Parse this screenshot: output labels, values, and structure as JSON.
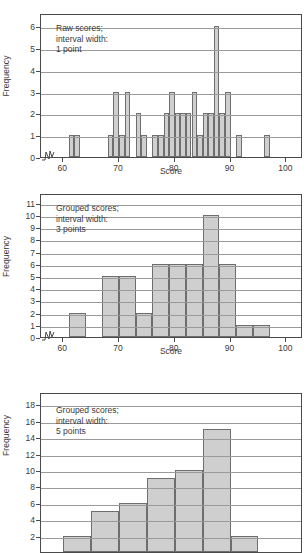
{
  "figures": [
    {
      "id": "histogram-raw-1pt",
      "annotation_lines": [
        "Raw scores;",
        "interval width:",
        "1 point"
      ],
      "chart_data": {
        "type": "bar",
        "title": "Raw scores; interval width: 1 point",
        "xlabel": "Score",
        "ylabel": "Frequency",
        "xlim": [
          56,
          103
        ],
        "ylim": [
          0,
          6.6
        ],
        "xticks": [
          60,
          70,
          80,
          90,
          100
        ],
        "yticks": [
          0,
          1,
          2,
          3,
          4,
          5,
          6
        ],
        "grid": true,
        "axis_break": true,
        "bin_width": 1,
        "categories": [
          61,
          62,
          68,
          69,
          70,
          71,
          73,
          74,
          76,
          77,
          78,
          79,
          80,
          81,
          82,
          83,
          84,
          85,
          86,
          87,
          88,
          89,
          91,
          96
        ],
        "values": [
          1,
          1,
          1,
          3,
          1,
          3,
          2,
          1,
          1,
          1,
          2,
          3,
          2,
          2,
          2,
          3,
          1,
          2,
          2,
          6,
          2,
          3,
          1,
          1
        ]
      }
    },
    {
      "id": "histogram-grouped-3pt",
      "annotation_lines": [
        "Grouped scores;",
        "interval width:",
        "3 points"
      ],
      "chart_data": {
        "type": "bar",
        "title": "Grouped scores; interval width: 3 points",
        "xlabel": "Score",
        "ylabel": "Frequency",
        "xlim": [
          56,
          103
        ],
        "ylim": [
          0,
          11.8
        ],
        "xticks": [
          60,
          70,
          80,
          90,
          100
        ],
        "yticks": [
          0,
          1,
          2,
          3,
          4,
          5,
          6,
          7,
          8,
          9,
          10,
          11
        ],
        "grid": true,
        "axis_break": true,
        "bin_width": 3,
        "categories": [
          61,
          67,
          70,
          73,
          76,
          79,
          82,
          85,
          88,
          91,
          94
        ],
        "values": [
          2,
          5,
          5,
          2,
          6,
          6,
          6,
          10,
          6,
          1,
          1
        ]
      }
    },
    {
      "id": "histogram-grouped-5pt",
      "annotation_lines": [
        "Grouped scores;",
        "interval width:",
        "5 points"
      ],
      "chart_data": {
        "type": "bar",
        "title": "Grouped scores; interval width: 5 points",
        "xlabel": "Score",
        "ylabel": "Frequency",
        "xlim": [
          56,
          103
        ],
        "ylim": [
          0,
          19.5
        ],
        "xticks": [],
        "yticks": [
          2,
          4,
          6,
          8,
          10,
          12,
          14,
          16,
          18
        ],
        "grid": true,
        "axis_break": true,
        "bin_width": 5,
        "categories": [
          60,
          65,
          70,
          75,
          80,
          85,
          90
        ],
        "values": [
          2,
          5,
          6,
          9,
          10,
          15,
          2
        ],
        "clipped_bottom": true
      }
    }
  ],
  "colors": {
    "bar_fill": "#cfcfcf",
    "bar_stroke": "#6e6e6e",
    "frame": "#4a4a4a",
    "grid": "#9a9a9a",
    "text": "#3a3a3a",
    "background": "#ffffff"
  }
}
